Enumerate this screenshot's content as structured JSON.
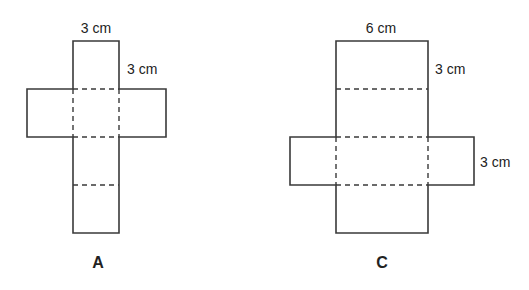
{
  "diagram": {
    "net_a": {
      "title": "A",
      "labels": {
        "top_width": "3 cm",
        "side_height": "3 cm"
      }
    },
    "net_c": {
      "title": "C",
      "labels": {
        "top_width": "6 cm",
        "side_height": "3 cm",
        "arm_height": "3 cm"
      }
    }
  }
}
